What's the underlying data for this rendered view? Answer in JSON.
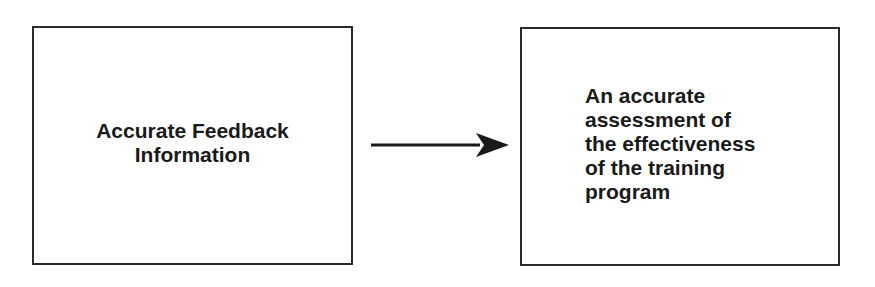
{
  "diagram": {
    "type": "flow",
    "nodes": [
      {
        "id": "feedback",
        "lines": [
          "Accurate Feedback",
          "Information"
        ]
      },
      {
        "id": "assessment",
        "lines": [
          "An accurate",
          "assessment of",
          "the effectiveness",
          "of the training",
          "program"
        ]
      }
    ],
    "edges": [
      {
        "from": "feedback",
        "to": "assessment",
        "style": "solid-arrow"
      }
    ],
    "colors": {
      "border": "#2a2a2a",
      "text": "#1a1a1a",
      "arrow": "#1a1a1a",
      "background": "#ffffff"
    }
  }
}
